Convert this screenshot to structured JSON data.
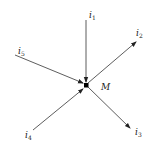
{
  "diagram": {
    "node": {
      "label": "M",
      "x": 86,
      "y": 85
    },
    "currents": [
      {
        "id": "i1",
        "base": "i",
        "sub": "1",
        "direction": "in",
        "from": [
          86,
          20
        ],
        "to": [
          86,
          82
        ],
        "label_pos": [
          89,
          17
        ]
      },
      {
        "id": "i2",
        "base": "i",
        "sub": "2",
        "direction": "out",
        "from": [
          88,
          83
        ],
        "to": [
          136,
          42
        ],
        "label_pos": [
          136,
          35
        ]
      },
      {
        "id": "i3",
        "base": "i",
        "sub": "3",
        "direction": "out",
        "from": [
          88,
          87
        ],
        "to": [
          130,
          128
        ],
        "label_pos": [
          135,
          134
        ]
      },
      {
        "id": "i4",
        "base": "i",
        "sub": "4",
        "direction": "in",
        "from": [
          33,
          130
        ],
        "to": [
          83,
          89
        ],
        "label_pos": [
          25,
          137
        ]
      },
      {
        "id": "i5",
        "base": "i",
        "sub": "5",
        "direction": "in",
        "from": [
          15,
          55
        ],
        "to": [
          83,
          83
        ],
        "label_pos": [
          18,
          53
        ]
      }
    ],
    "colors": {
      "line": "#333333",
      "node": "#000000",
      "text": "#222222"
    }
  }
}
